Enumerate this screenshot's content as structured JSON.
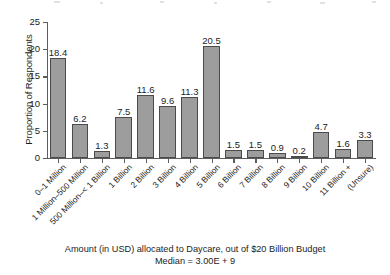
{
  "chart_data": {
    "type": "bar",
    "title": "",
    "xlabel": "Amount (in USD) allocated to Daycare, out of $20 Billion Budget",
    "ylabel": "Proportion of Respondents",
    "ylim": [
      0,
      25
    ],
    "yticks": [
      0,
      5,
      10,
      15,
      20,
      25
    ],
    "grid": false,
    "legend": "none",
    "categories": [
      "0–1 Million",
      "1 Million–500 Million",
      "500 Million–< 1 Billion",
      "1 Billion",
      "2 Billion",
      "3 Billion",
      "4 Billion",
      "5 Billion",
      "6 Billion",
      "7 Billion",
      "8 Billion",
      "9 Billion",
      "10 Billion",
      "11 Billion +",
      "(Unsure)"
    ],
    "values": [
      18.4,
      6.2,
      1.3,
      7.5,
      11.6,
      9.6,
      11.3,
      20.5,
      1.5,
      1.5,
      0.9,
      0.2,
      4.7,
      1.6,
      3.3
    ],
    "data_labels": [
      "18.4",
      "6.2",
      "1.3",
      "7.5",
      "11.6",
      "9.6",
      "11.3",
      "20.5",
      "1.5",
      "1.5",
      "0.9",
      "0.2",
      "4.7",
      "1.6",
      "3.3"
    ],
    "annotations": [
      "Amount (in USD) allocated to Daycare, out of $20 Billion Budget",
      "Median = 3.00E + 9"
    ],
    "bar_color": "#9d9d9d",
    "bar_edge_color": "#4b4b4b",
    "axis_color": "#5d5d5d"
  },
  "caption": {
    "line1": "Amount (in USD) allocated to Daycare, out of $20 Billion Budget",
    "line2": "Median = 3.00E + 9"
  },
  "axes": {
    "y_title": "Proportion of Respondents",
    "y_tick_labels": [
      "0",
      "5",
      "10",
      "15",
      "20",
      "25"
    ]
  }
}
